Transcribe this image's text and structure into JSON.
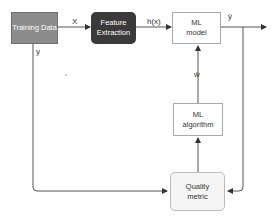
{
  "diagram": {
    "nodes": {
      "training_data": {
        "label": "Training Data",
        "fill": "#8c8c8c",
        "text_color": "#ffffff"
      },
      "feature_extraction": {
        "label": "Feature Extraction",
        "fill": "#3a3a3a",
        "text_color": "#ffffff"
      },
      "ml_model": {
        "label": "ML model",
        "fill": "#ffffff",
        "text_color": "#333333"
      },
      "ml_algorithm": {
        "label": "ML algorithm",
        "fill": "#ffffff",
        "text_color": "#333333"
      },
      "quality_metric": {
        "label": "Quality metric",
        "fill": "#f5f5f5",
        "text_color": "#333333"
      }
    },
    "edges": {
      "x": "X",
      "hx": "h(x)",
      "yhat": "ŷ",
      "w": "ŵ",
      "y": "y"
    }
  }
}
